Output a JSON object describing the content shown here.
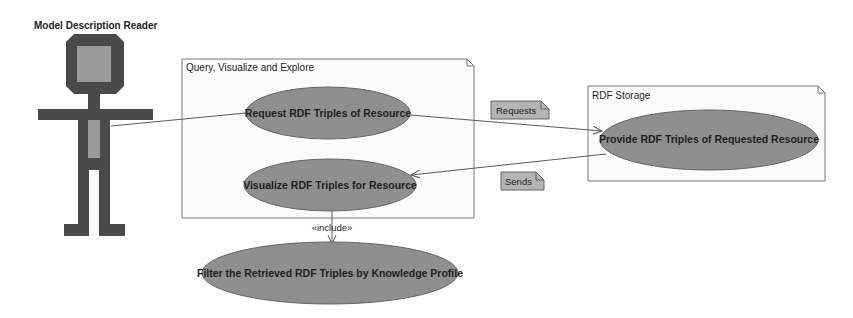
{
  "diagram": {
    "type": "uml-use-case",
    "actor": {
      "name": "Model Description Reader"
    },
    "packages": [
      {
        "title": "Query, Visualize and Explore",
        "use_cases": [
          "Request RDF Triples of Resource",
          "Visualize RDF Triples for Resource"
        ]
      },
      {
        "title": "RDF Storage",
        "use_cases": [
          "Provide RDF Triples of Requested Resource"
        ]
      }
    ],
    "external_use_cases": [
      "Filter the Retrieved RDF Triples by Knowledge Profile"
    ],
    "notes": [
      "Requests",
      "Sends"
    ],
    "relationships": {
      "include_label": "«include»"
    },
    "colors": {
      "use_case_fill": "#8f8f8f",
      "actor_dark": "#4a4a4a",
      "actor_light": "#9a9a9a",
      "note_fill": "#b4b4b4",
      "package_fill": "#fbfbfb",
      "line": "#5a5a5a"
    }
  }
}
